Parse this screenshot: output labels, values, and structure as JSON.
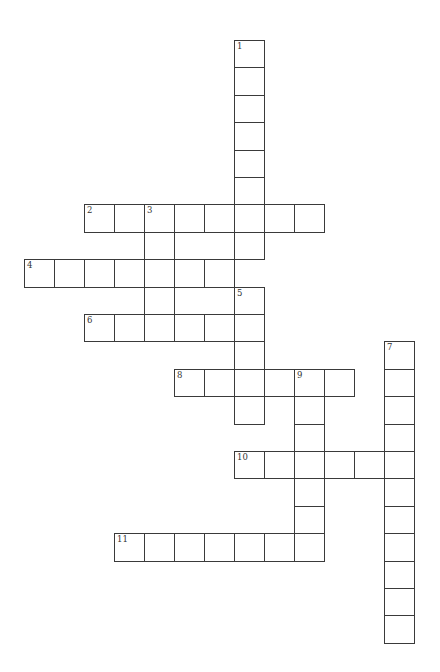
{
  "puzzle": {
    "type": "crossword",
    "cell_width": 30,
    "cell_height": 27.4,
    "origin_x": 24,
    "origin_y": 40,
    "line_color": "#3a3a3a",
    "words": [
      {
        "number": "1",
        "direction": "down",
        "col": 7,
        "row": 0,
        "length": 8
      },
      {
        "number": "2",
        "direction": "across",
        "col": 2,
        "row": 6,
        "length": 8
      },
      {
        "number": "3",
        "direction": "down",
        "col": 4,
        "row": 6,
        "length": 4
      },
      {
        "number": "4",
        "direction": "across",
        "col": 0,
        "row": 8,
        "length": 7
      },
      {
        "number": "5",
        "direction": "down",
        "col": 7,
        "row": 9,
        "length": 5
      },
      {
        "number": "6",
        "direction": "across",
        "col": 2,
        "row": 10,
        "length": 6
      },
      {
        "number": "7",
        "direction": "down",
        "col": 12,
        "row": 11,
        "length": 11
      },
      {
        "number": "8",
        "direction": "across",
        "col": 5,
        "row": 12,
        "length": 6
      },
      {
        "number": "9",
        "direction": "down",
        "col": 9,
        "row": 12,
        "length": 7
      },
      {
        "number": "10",
        "direction": "across",
        "col": 7,
        "row": 15,
        "length": 6
      },
      {
        "number": "11",
        "direction": "across",
        "col": 3,
        "row": 18,
        "length": 7
      }
    ]
  }
}
